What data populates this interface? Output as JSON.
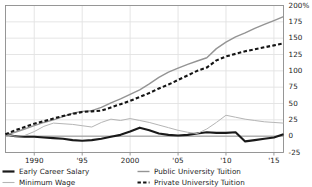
{
  "chart_data": {
    "type": "line",
    "title": "",
    "subtitle": "",
    "xlabel": "",
    "ylabel": "",
    "xlim": [
      1987,
      2016
    ],
    "ylim": [
      -25,
      200
    ],
    "grid": true,
    "legend_position": "below",
    "x_ticks": [
      {
        "value": 1990,
        "label": "1990"
      },
      {
        "value": 1995,
        "label": "'95"
      },
      {
        "value": 2000,
        "label": "2000"
      },
      {
        "value": 2005,
        "label": "'05"
      },
      {
        "value": 2010,
        "label": "'10"
      },
      {
        "value": 2015,
        "label": "'15"
      }
    ],
    "y_ticks": [
      {
        "value": 200,
        "label": "200%"
      },
      {
        "value": 175,
        "label": "175"
      },
      {
        "value": 150,
        "label": "150"
      },
      {
        "value": 125,
        "label": "125"
      },
      {
        "value": 100,
        "label": "100"
      },
      {
        "value": 75,
        "label": "75"
      },
      {
        "value": 50,
        "label": "50"
      },
      {
        "value": 25,
        "label": "25"
      },
      {
        "value": 0,
        "label": "0"
      },
      {
        "value": -25,
        "label": "-25"
      }
    ],
    "x": [
      1987,
      1988,
      1989,
      1990,
      1991,
      1992,
      1993,
      1994,
      1995,
      1996,
      1997,
      1998,
      1999,
      2000,
      2001,
      2002,
      2003,
      2004,
      2005,
      2006,
      2007,
      2008,
      2009,
      2010,
      2011,
      2012,
      2013,
      2014,
      2015,
      2016
    ],
    "series": [
      {
        "name": "Early Career Salary",
        "values": [
          3,
          0,
          -1,
          -1,
          -2,
          -3,
          -4,
          -6,
          -7,
          -6,
          -4,
          -1,
          2,
          7,
          13,
          9,
          4,
          2,
          1,
          2,
          4,
          6,
          5,
          5,
          6,
          -8,
          -6,
          -4,
          -2,
          3
        ],
        "color": "#1a1a1a",
        "style": "solid",
        "width": 2.1
      },
      {
        "name": "Minimum Wage",
        "values": [
          2,
          0,
          1,
          7,
          15,
          20,
          19,
          18,
          16,
          14,
          21,
          26,
          24,
          27,
          24,
          21,
          17,
          13,
          9,
          6,
          4,
          11,
          21,
          32,
          29,
          26,
          24,
          22,
          21,
          20
        ],
        "color": "#b5b5b5",
        "style": "solid",
        "width": 1.0
      },
      {
        "name": "Public University Tuition",
        "values": [
          2,
          6,
          11,
          16,
          21,
          25,
          30,
          35,
          38,
          39,
          44,
          51,
          57,
          64,
          71,
          80,
          90,
          98,
          104,
          110,
          115,
          120,
          134,
          144,
          152,
          158,
          165,
          171,
          177,
          183
        ],
        "color": "#949494",
        "style": "solid",
        "width": 1.4
      },
      {
        "name": "Private University Tuition",
        "values": [
          3,
          9,
          14,
          19,
          23,
          27,
          31,
          34,
          37,
          38,
          39,
          44,
          49,
          54,
          60,
          66,
          73,
          79,
          86,
          93,
          100,
          105,
          116,
          122,
          126,
          130,
          133,
          136,
          139,
          142
        ],
        "color": "#141414",
        "style": "dashed",
        "width": 2.1
      }
    ]
  },
  "legend": {
    "left_entries": [
      {
        "label": "Early Career Salary",
        "swatch": "thick-solid-black-line-swatch"
      },
      {
        "label": "Minimum Wage",
        "swatch": "thin-solid-gray-line-swatch"
      }
    ],
    "right_entries": [
      {
        "label": "Public University Tuition",
        "swatch": "solid-gray-line-swatch"
      },
      {
        "label": "Private University Tuition",
        "swatch": "dashed-black-line-swatch"
      }
    ]
  },
  "axes": {
    "grid_color": "#e2e2e2",
    "frame_color": "#8c8c8c",
    "zero_line_color": "#8a8a8a",
    "tick_text_color": "#1b1b1b"
  }
}
